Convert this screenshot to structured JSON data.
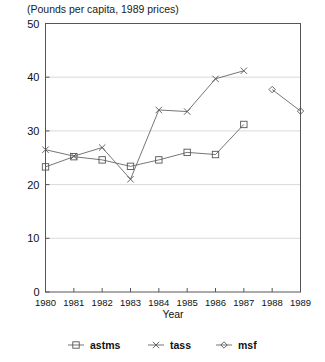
{
  "chart_data": {
    "type": "line",
    "title": "(Pounds per capita, 1989 prices)",
    "xlabel": "Year",
    "ylabel": "",
    "categories": [
      "1980",
      "1981",
      "1982",
      "1983",
      "1984",
      "1985",
      "1986",
      "1987",
      "1988",
      "1989"
    ],
    "x": [
      1980,
      1981,
      1982,
      1983,
      1984,
      1985,
      1986,
      1987,
      1988,
      1989
    ],
    "xlim": [
      1980,
      1989
    ],
    "ylim": [
      0,
      50
    ],
    "yticks": [
      0,
      10,
      20,
      30,
      40,
      50
    ],
    "ytick_labels": [
      "0",
      "10",
      "20",
      "30",
      "40",
      "50"
    ],
    "grid": true,
    "legend_position": "below",
    "series": [
      {
        "name": "astms",
        "marker": "square",
        "values": [
          23.3,
          25.2,
          24.6,
          23.4,
          24.6,
          26.0,
          25.6,
          31.2,
          null,
          null
        ]
      },
      {
        "name": "tass",
        "marker": "x",
        "values": [
          26.5,
          25.3,
          26.9,
          21.0,
          33.9,
          33.6,
          39.7,
          41.2,
          null,
          null
        ]
      },
      {
        "name": "msf",
        "marker": "diamond",
        "values": [
          null,
          null,
          null,
          null,
          null,
          null,
          null,
          null,
          37.7,
          33.7
        ]
      }
    ]
  },
  "legend": {
    "items": [
      {
        "label": "astms",
        "marker": "square"
      },
      {
        "label": "tass",
        "marker": "x"
      },
      {
        "label": "msf",
        "marker": "diamond"
      }
    ]
  }
}
